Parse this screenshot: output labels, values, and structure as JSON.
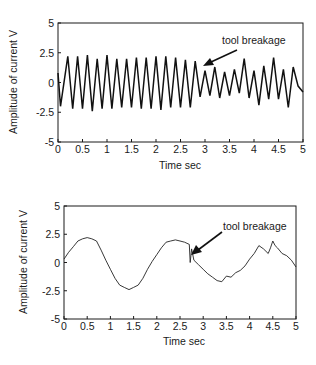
{
  "figure": {
    "top": {
      "ylabel": "Amplitude of current  V",
      "xlabel": "Time  sec",
      "annotation": "tool  breakage",
      "yticks": [
        "5",
        "2.5",
        "0",
        "-2.5",
        "-5"
      ],
      "xticks": [
        "0",
        "0.5",
        "1",
        "1.5",
        "2",
        "2.5",
        "3",
        "3.5",
        "4",
        "4.5",
        "5"
      ]
    },
    "bottom": {
      "ylabel": "Amplitude of current  V",
      "xlabel": "Time  sec",
      "annotation": "tool  breakage",
      "yticks": [
        "5",
        "2.5",
        "0",
        "-2.5",
        "-5"
      ],
      "xticks": [
        "0",
        "0.5",
        "1",
        "1.5",
        "2",
        "2.5",
        "3",
        "3.5",
        "4",
        "4.5",
        "5"
      ]
    }
  },
  "chart_data": [
    {
      "type": "line",
      "title": "",
      "xlabel": "Time  sec",
      "ylabel": "Amplitude of current  V",
      "xlim": [
        0,
        5
      ],
      "ylim": [
        -5,
        5
      ],
      "grid": false,
      "annotations": [
        {
          "text": "tool  breakage",
          "x": 2.95,
          "y": 1.2
        }
      ],
      "series": [
        {
          "name": "current (before breakage: regular ~5 Hz oscillation ±2.2 V, after: reduced amplitude)",
          "x": [
            0,
            0.05,
            0.2,
            0.3,
            0.4,
            0.5,
            0.6,
            0.7,
            0.8,
            0.9,
            1.0,
            1.1,
            1.2,
            1.3,
            1.4,
            1.5,
            1.6,
            1.7,
            1.8,
            1.9,
            2.0,
            2.1,
            2.2,
            2.3,
            2.4,
            2.5,
            2.6,
            2.7,
            2.8,
            2.9,
            3.0,
            3.1,
            3.2,
            3.3,
            3.4,
            3.5,
            3.6,
            3.7,
            3.8,
            3.9,
            4.0,
            4.1,
            4.2,
            4.3,
            4.4,
            4.5,
            4.6,
            4.7,
            4.8,
            4.9,
            5.0
          ],
          "y": [
            0.8,
            -2.0,
            2.2,
            -2.2,
            2.2,
            -2.2,
            2.3,
            -2.4,
            2.0,
            -2.2,
            2.3,
            -2.2,
            2.0,
            -2.1,
            2.0,
            -2.1,
            2.1,
            -2.2,
            2.1,
            -2.2,
            2.2,
            -2.3,
            2.2,
            -2.1,
            2.1,
            -2.1,
            1.9,
            -2.1,
            1.8,
            -1.2,
            1.0,
            -1.1,
            1.3,
            -1.3,
            0.9,
            -1.1,
            1.1,
            -0.9,
            2.0,
            -1.3,
            1.0,
            -1.9,
            1.4,
            -1.4,
            2.1,
            -1.4,
            1.1,
            -2.1,
            1.3,
            -0.3,
            -0.8
          ]
        }
      ]
    },
    {
      "type": "line",
      "title": "",
      "xlabel": "Time  sec",
      "ylabel": "Amplitude of current  V",
      "xlim": [
        0,
        5
      ],
      "ylim": [
        -5,
        5
      ],
      "grid": false,
      "annotations": [
        {
          "text": "tool  breakage",
          "x": 2.75,
          "y": 1.0
        }
      ],
      "series": [
        {
          "name": "current (low-frequency ~0.5 Hz, breakage spike at ~2.7 s)",
          "x": [
            0,
            0.1,
            0.2,
            0.3,
            0.4,
            0.5,
            0.6,
            0.7,
            0.8,
            0.9,
            1.0,
            1.1,
            1.2,
            1.3,
            1.4,
            1.5,
            1.6,
            1.7,
            1.8,
            1.9,
            2.0,
            2.1,
            2.2,
            2.3,
            2.4,
            2.5,
            2.6,
            2.7,
            2.72,
            2.75,
            2.8,
            2.9,
            3.0,
            3.1,
            3.2,
            3.3,
            3.4,
            3.5,
            3.6,
            3.7,
            3.8,
            3.9,
            4.0,
            4.1,
            4.2,
            4.3,
            4.4,
            4.45,
            4.5,
            4.55,
            4.6,
            4.7,
            4.8,
            4.9,
            5.0
          ],
          "y": [
            0.3,
            0.9,
            1.4,
            1.9,
            2.1,
            2.2,
            2.1,
            1.9,
            1.1,
            0.2,
            -0.6,
            -1.4,
            -2.0,
            -2.2,
            -2.4,
            -2.2,
            -2.0,
            -1.4,
            -0.6,
            0.1,
            0.7,
            1.3,
            1.8,
            1.9,
            2.0,
            1.9,
            1.8,
            1.6,
            0.0,
            1.2,
            0.2,
            -0.2,
            -0.6,
            -1.0,
            -1.3,
            -1.6,
            -1.7,
            -1.2,
            -1.3,
            -0.9,
            -0.7,
            -0.3,
            0.3,
            0.8,
            1.5,
            1.2,
            0.8,
            1.3,
            1.9,
            1.5,
            1.3,
            0.8,
            0.6,
            0.2,
            -0.4
          ]
        }
      ]
    }
  ]
}
